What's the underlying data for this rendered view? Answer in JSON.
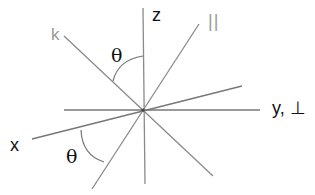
{
  "diagram": {
    "title": "",
    "colors": {
      "line": "#8a8a8a",
      "dark_line": "#777777",
      "label_dark": "#111111",
      "label_gray": "#9a9a9a",
      "background": "#ffffff"
    },
    "labels": {
      "z": "z",
      "k": "k",
      "parallel": "||",
      "y_perp": "y, ⊥",
      "x": "x",
      "theta_top": "θ",
      "theta_bottom": "θ"
    },
    "axes": [
      {
        "name": "z-axis",
        "from": [
          143,
          8
        ],
        "to": [
          145,
          184
        ]
      },
      {
        "name": "k-vector",
        "from": [
          64,
          36
        ],
        "to": [
          213,
          176
        ]
      },
      {
        "name": "parallel-axis",
        "from": [
          199,
          24
        ],
        "to": [
          92,
          189
        ]
      },
      {
        "name": "y-perp-axis",
        "from": [
          64,
          110
        ],
        "to": [
          260,
          110
        ]
      },
      {
        "name": "x-axis",
        "from": [
          32,
          139
        ],
        "to": [
          242,
          86
        ]
      }
    ],
    "angles": [
      {
        "name": "theta-between-k-and-z",
        "label": "θ"
      },
      {
        "name": "theta-between-x-and-parallel",
        "label": "θ"
      }
    ]
  }
}
